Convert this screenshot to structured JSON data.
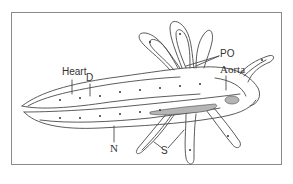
{
  "figure": {
    "labels": {
      "heart": "Heart",
      "d": "D",
      "po": "PO",
      "aorta": "Aorta",
      "n": "N",
      "s": "S"
    },
    "colors": {
      "line": "#4a4a4a",
      "frame": "#8a8a8a",
      "shade": "#b5b5b5",
      "background": "#ffffff"
    }
  }
}
